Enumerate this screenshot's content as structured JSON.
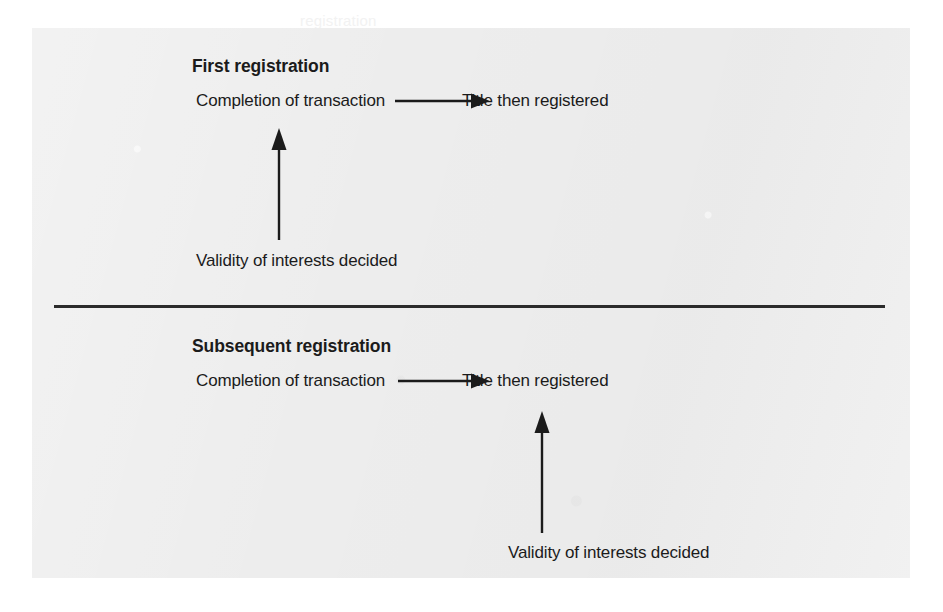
{
  "figure": {
    "panel_background": "#ededed",
    "ink_color": "#1b1b1b",
    "rule_color": "#2b2b2b",
    "sections": [
      {
        "id": "first-registration",
        "heading": "First registration",
        "source_label": "Completion of transaction",
        "target_label": "Title then registered",
        "vertical_label": "Validity of interests decided",
        "flow_arrow": "arrow-right",
        "vertical_arrow": "arrow-up",
        "vertical_arrow_anchor": "source"
      },
      {
        "id": "subsequent-registration",
        "heading": "Subsequent registration",
        "source_label": "Completion of transaction",
        "target_label": "Title then registered",
        "vertical_label": "Validity of interests decided",
        "flow_arrow": "arrow-right",
        "vertical_arrow": "arrow-up",
        "vertical_arrow_anchor": "target"
      }
    ]
  },
  "page_bleed": {
    "lines": [
      "registration",
      "interests and their priority",
      "a purchaser of a registered title",
      "the register is conclusive as to",
      "priority",
      "Titles which are subject to registration",
      "not be registered unless the estate is"
    ]
  }
}
